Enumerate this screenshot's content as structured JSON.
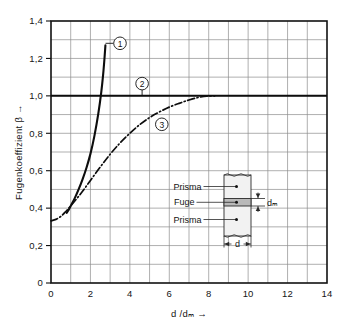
{
  "chart_data": {
    "type": "line",
    "title": "",
    "xlabel": "d /dₘ  →",
    "ylabel": "Fugenkoeffizient β  →",
    "xlim": [
      0,
      14
    ],
    "ylim": [
      0,
      1.4
    ],
    "grid": true,
    "x_major_step": 2,
    "x_minor_step": 1,
    "y_major_step": 0.2,
    "y_minor_step": 0.1,
    "x_tick_labels": [
      "0",
      "2",
      "4",
      "6",
      "8",
      "10",
      "12",
      "14"
    ],
    "x_tick_values": [
      0,
      2,
      4,
      6,
      8,
      10,
      12,
      14
    ],
    "y_tick_labels": [
      "0",
      "0,2",
      "0,4",
      "0,6",
      "0,8",
      "1,0",
      "1,2",
      "1,4"
    ],
    "y_tick_values": [
      0,
      0.2,
      0.4,
      0.6,
      0.8,
      1.0,
      1.2,
      1.4
    ],
    "legend_position": "inline-callouts",
    "series": [
      {
        "name": "1",
        "callout_label": "1",
        "style": "solid-thick",
        "points": [
          [
            0.8,
            0.375
          ],
          [
            0.9,
            0.392
          ],
          [
            1.0,
            0.412
          ],
          [
            1.2,
            0.452
          ],
          [
            1.4,
            0.5
          ],
          [
            1.6,
            0.554
          ],
          [
            1.8,
            0.616
          ],
          [
            2.0,
            0.69
          ],
          [
            2.2,
            0.785
          ],
          [
            2.4,
            0.905
          ],
          [
            2.55,
            1.02
          ],
          [
            2.65,
            1.12
          ],
          [
            2.72,
            1.21
          ],
          [
            2.76,
            1.27
          ]
        ],
        "callout_xy": [
          3.3,
          1.268
        ]
      },
      {
        "name": "2",
        "callout_label": "2",
        "style": "solid-horizontal",
        "points": [
          [
            0.0,
            1.0
          ],
          [
            14.0,
            1.0
          ]
        ],
        "callout_xy": [
          4.62,
          1.075
        ]
      },
      {
        "name": "3",
        "callout_label": "3",
        "style": "dash-dot",
        "points": [
          [
            0.0,
            0.332
          ],
          [
            0.25,
            0.34
          ],
          [
            0.5,
            0.356
          ],
          [
            0.75,
            0.382
          ],
          [
            1.0,
            0.412
          ],
          [
            1.3,
            0.45
          ],
          [
            1.6,
            0.49
          ],
          [
            2.0,
            0.548
          ],
          [
            2.5,
            0.62
          ],
          [
            3.0,
            0.688
          ],
          [
            3.5,
            0.748
          ],
          [
            4.0,
            0.8
          ],
          [
            4.5,
            0.846
          ],
          [
            5.0,
            0.884
          ],
          [
            5.5,
            0.914
          ],
          [
            6.0,
            0.94
          ],
          [
            6.5,
            0.96
          ],
          [
            7.0,
            0.978
          ],
          [
            7.5,
            0.992
          ],
          [
            7.9,
            0.999
          ],
          [
            8.3,
            1.0
          ]
        ],
        "callout_xy": [
          5.62,
          0.855
        ]
      }
    ]
  },
  "inset": {
    "name": "prisma-fuge-diagram",
    "labels": {
      "top": "Prisma",
      "middle": "Fuge",
      "bottom": "Prisma",
      "width_dim": "d",
      "thickness_dim": "dₘ"
    }
  }
}
